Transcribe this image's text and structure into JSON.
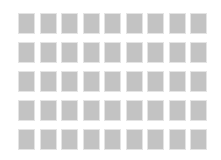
{
  "grid": {
    "rows": 5,
    "columns": 9,
    "tile_color": "#c3c3c3",
    "background_color": "#ffffff"
  }
}
